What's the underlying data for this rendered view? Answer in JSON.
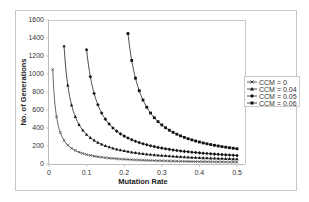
{
  "chart_data": {
    "type": "line",
    "title": "",
    "xlabel": "Mutation Rate",
    "ylabel": "No. of Generations",
    "xlim": [
      0,
      0.5
    ],
    "ylim": [
      0,
      1600
    ],
    "x_ticks": [
      "0",
      "0.1",
      "0.2",
      "0.3",
      "0.4",
      "0.5"
    ],
    "y_ticks": [
      "0",
      "200",
      "400",
      "600",
      "800",
      "1000",
      "1200",
      "1400",
      "1600"
    ],
    "grid": {
      "horizontal": "top border only",
      "vertical": false
    },
    "legend_position": "right",
    "series": [
      {
        "name": "CCM = 0",
        "marker": "x",
        "x_start": 0.01,
        "x_end": 0.5,
        "x_step": 0.01,
        "model": "10.5/x",
        "sample_points": [
          [
            0.01,
            1050
          ],
          [
            0.02,
            525
          ],
          [
            0.05,
            210
          ],
          [
            0.1,
            105
          ],
          [
            0.2,
            53
          ],
          [
            0.3,
            35
          ],
          [
            0.4,
            26
          ],
          [
            0.5,
            21
          ]
        ]
      },
      {
        "name": "CCM = 0.04",
        "marker": "triangle",
        "x_start": 0.04,
        "x_end": 0.5,
        "x_step": 0.01,
        "model": "26.2/(x-0.02)",
        "sample_points": [
          [
            0.04,
            1310
          ],
          [
            0.05,
            873
          ],
          [
            0.1,
            328
          ],
          [
            0.2,
            146
          ],
          [
            0.3,
            94
          ],
          [
            0.4,
            69
          ],
          [
            0.5,
            55
          ]
        ]
      },
      {
        "name": "CCM = 0.05",
        "marker": "diamond",
        "x_start": 0.1,
        "x_end": 0.5,
        "x_step": 0.01,
        "model": "41/(x-0.0677)",
        "sample_points": [
          [
            0.1,
            1270
          ],
          [
            0.15,
            498
          ],
          [
            0.2,
            310
          ],
          [
            0.3,
            176
          ],
          [
            0.4,
            123
          ],
          [
            0.5,
            95
          ]
        ]
      },
      {
        "name": "CCM = 0.06",
        "marker": "square",
        "x_start": 0.21,
        "x_end": 0.5,
        "x_step": 0.01,
        "model": "55.8/(x-0.1715)",
        "sample_points": [
          [
            0.21,
            1450
          ],
          [
            0.25,
            711
          ],
          [
            0.3,
            434
          ],
          [
            0.4,
            244
          ],
          [
            0.5,
            170
          ]
        ]
      }
    ]
  },
  "labels": {
    "xlabel": "Mutation Rate",
    "ylabel": "No. of Generations",
    "legend": [
      "CCM = 0",
      "CCM = 0.04",
      "CCM = 0.05",
      "CCM = 0.06"
    ]
  }
}
